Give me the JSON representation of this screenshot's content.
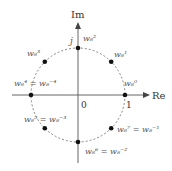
{
  "diagram": {
    "axes": {
      "x_label": "Re",
      "y_label": "Im",
      "origin_label": "0",
      "one_label": "1",
      "j_label": "j"
    },
    "circle": {
      "center": [
        78,
        95
      ],
      "radius": 47
    },
    "points": [
      {
        "k": 0,
        "label": "w",
        "sub": "8",
        "sup": "0",
        "alt": ""
      },
      {
        "k": 1,
        "label": "w",
        "sub": "8",
        "sup": "1",
        "alt": ""
      },
      {
        "k": 2,
        "label": "w",
        "sub": "8",
        "sup": "2",
        "alt": ""
      },
      {
        "k": 3,
        "label": "w",
        "sub": "8",
        "sup": "3",
        "alt": ""
      },
      {
        "k": 4,
        "label": "w",
        "sub": "8",
        "sup": "4",
        "alt": "= w₈⁻⁴"
      },
      {
        "k": 5,
        "label": "w",
        "sub": "8",
        "sup": "5",
        "alt": "= w₈⁻³"
      },
      {
        "k": 6,
        "label": "w",
        "sub": "8",
        "sup": "6",
        "alt": "= w₈⁻²"
      },
      {
        "k": 7,
        "label": "w",
        "sub": "8",
        "sup": "7",
        "alt": "= w₈⁻¹"
      }
    ],
    "text": {
      "w0": "w₈⁰",
      "w1": "w₈¹",
      "w2": "w₈²",
      "w3": "w₈³",
      "w4": "w₈⁴ = w₈⁻⁴",
      "w5": "w₈⁵ = w₈⁻³",
      "w6": "w₈⁶ = w₈⁻²",
      "w7": "w₈⁷ = w₈⁻¹"
    }
  }
}
